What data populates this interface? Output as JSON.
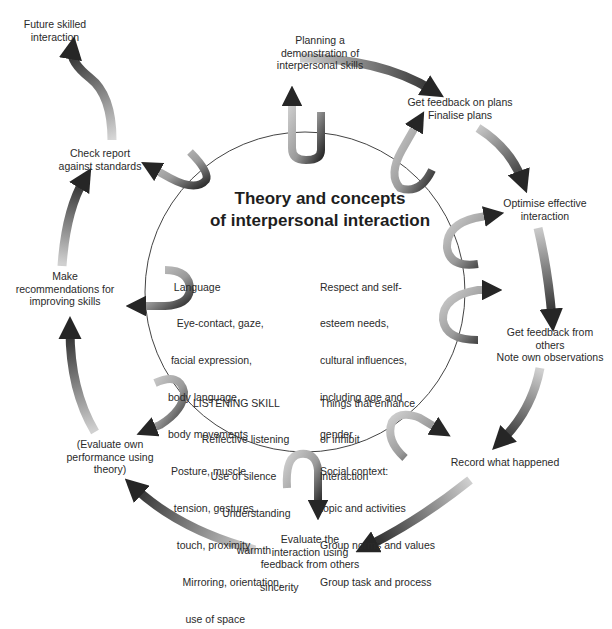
{
  "diagram": {
    "title": "Theory and concepts\nof interpersonal interaction",
    "cycle_nodes": [
      {
        "id": "planning",
        "label": "Planning a\ndemonstration of\ninterpersonal skills"
      },
      {
        "id": "feedback_plans",
        "label": "Get feedback on plans\nFinalise plans"
      },
      {
        "id": "optimise",
        "label": "Optimise effective\ninteraction"
      },
      {
        "id": "feedback_others",
        "label": "Get feedback from\nothers\nNote own observations"
      },
      {
        "id": "record",
        "label": "Record what happened"
      },
      {
        "id": "evaluate_interaction",
        "label": "Evaluate the\ninteraction using\nfeedback from others"
      },
      {
        "id": "evaluate_own",
        "label": "(Evaluate own\nperformance using\ntheory)"
      },
      {
        "id": "recommendations",
        "label": "Make\nrecommendations for\nimproving skills"
      },
      {
        "id": "check_report",
        "label": "Check report\nagainst standards"
      },
      {
        "id": "future",
        "label": "Future skilled\ninteraction"
      }
    ],
    "inner_left": {
      "lines": [
        "  Language",
        "   Eye-contact, gaze,",
        " facial expression,",
        "body language,",
        "body movements",
        " Posture, muscle",
        "  tension, gestures,",
        "   touch, proximity",
        "     Mirroring, orientation,",
        "      use of space"
      ]
    },
    "inner_listening": {
      "lines": [
        "LISTENING SKILL",
        "   Reflective listening",
        "      Use of silence",
        "          Understanding",
        "               warmth",
        "                       sincerity"
      ]
    },
    "inner_right": {
      "lines": [
        "Respect and self-",
        "esteem needs,",
        "cultural influences,",
        "including age and",
        "gender",
        "Social context:",
        "topic and activities",
        "Group norms and values",
        "Group task and process"
      ]
    },
    "inner_enhance": {
      "lines": [
        "Things that enhance",
        "or inhibit",
        "interaction"
      ]
    },
    "colors": {
      "arrow_dark": "#2b2b2b",
      "arrow_light": "#cfcfcf",
      "circle_stroke": "#444444",
      "text": "#2a2a2a"
    }
  }
}
